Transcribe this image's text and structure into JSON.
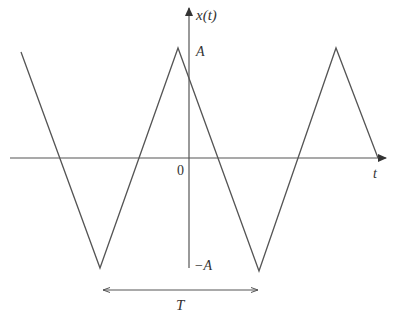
{
  "diagram": {
    "axes": {
      "y_label": "x(t)",
      "x_label": "t",
      "origin_label": "0"
    },
    "levels": {
      "max_label": "A",
      "min_label": "−A"
    },
    "period": {
      "label": "T"
    },
    "colors": {
      "axis": "#555555",
      "wave": "#555555",
      "text": "#333333"
    }
  }
}
